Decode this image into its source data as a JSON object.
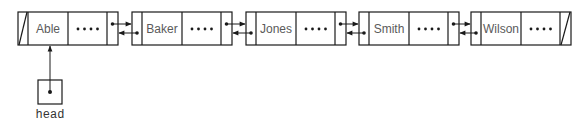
{
  "diagram": {
    "type": "doubly-linked-list",
    "colors": {
      "stroke": "#1a1a1a",
      "text": "#5a5a5a",
      "background": "#ffffff"
    },
    "nodes": [
      {
        "value": "Able",
        "rest": "....",
        "prev": "null",
        "next": "Baker"
      },
      {
        "value": "Baker",
        "rest": "....",
        "prev": "Able",
        "next": "Jones"
      },
      {
        "value": "Jones",
        "rest": "....",
        "prev": "Baker",
        "next": "Smith"
      },
      {
        "value": "Smith",
        "rest": "....",
        "prev": "Jones",
        "next": "Wilson"
      },
      {
        "value": "Wilson",
        "rest": "....",
        "prev": "Smith",
        "next": "null"
      }
    ],
    "head": {
      "label": "head",
      "points_to": "Able"
    }
  }
}
